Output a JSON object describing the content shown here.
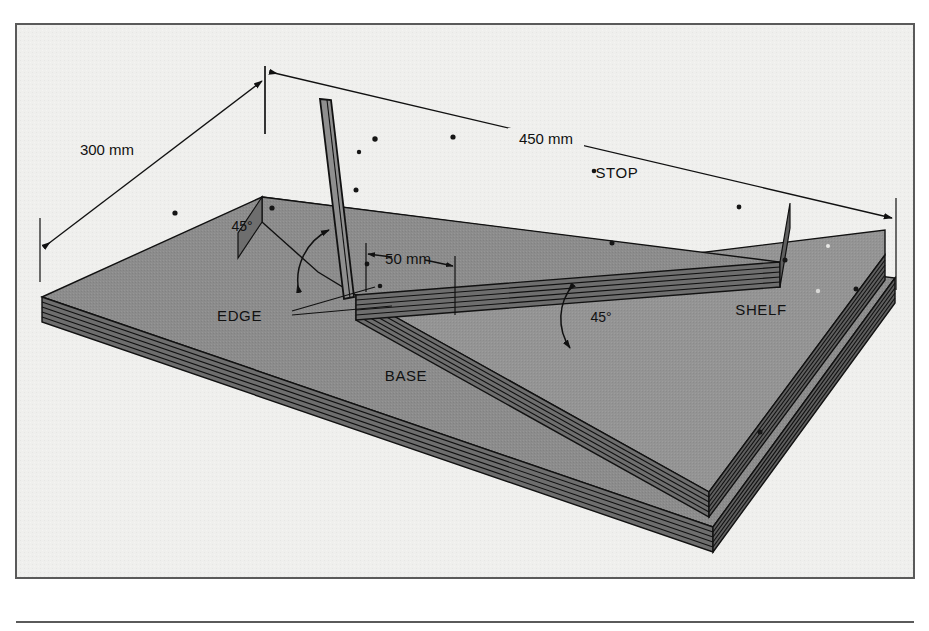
{
  "figure": {
    "background_color": "#efefed",
    "panel_face_color": "#8a8a8a",
    "panel_face_color_light": "#949494",
    "panel_edge_color": "#737373",
    "line_color": "#111111",
    "frame_color": "#5a5a5a"
  },
  "parts": [
    {
      "id": "stop",
      "label": "STOP",
      "x": 617,
      "y": 173
    },
    {
      "id": "shelf",
      "label": "SHELF",
      "x": 760,
      "y": 310
    },
    {
      "id": "base",
      "label": "BASE",
      "x": 405,
      "y": 375
    },
    {
      "id": "edge",
      "label": "EDGE",
      "x": 262,
      "y": 316
    }
  ],
  "dimensions": [
    {
      "id": "length-300",
      "label": "300 mm",
      "value": 300,
      "unit": "mm",
      "x": 107,
      "y": 153,
      "describes": "base depth front-to-back"
    },
    {
      "id": "length-450",
      "label": "450 mm",
      "value": 450,
      "unit": "mm",
      "x": 545,
      "y": 142,
      "describes": "base width along the stop"
    },
    {
      "id": "length-50",
      "label": "50 mm",
      "value": 50,
      "unit": "mm",
      "x": 405,
      "y": 259,
      "describes": "offset of shelf from stop edge"
    }
  ],
  "angles": [
    {
      "id": "angle-stop",
      "label": "45°",
      "value": 45,
      "unit": "degrees",
      "x": 242,
      "y": 231
    },
    {
      "id": "angle-shelf",
      "label": "45°",
      "value": 45,
      "unit": "degrees",
      "x": 600,
      "y": 322
    }
  ],
  "notes": {
    "lamination_count": 5,
    "screw_count_visible": 14
  }
}
